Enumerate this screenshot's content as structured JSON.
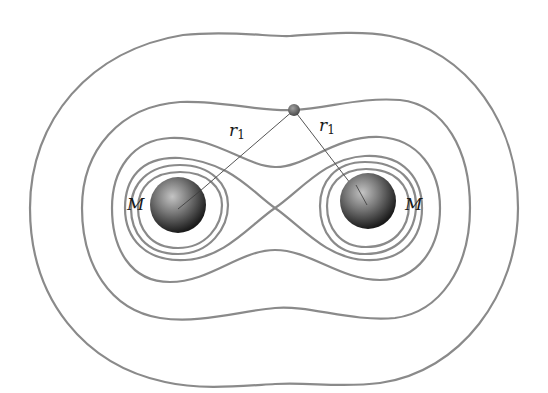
{
  "figure": {
    "labels": {
      "mass_left": "M",
      "mass_right": "M",
      "r_left_main": "r",
      "r_left_sub": "1",
      "r_right_main": "r",
      "r_right_sub": "1"
    },
    "colors": {
      "contour": "#8a8a8a",
      "line": "#555555",
      "sphere_dark": "#1e1e1e",
      "sphere_light": "#bdbdbd",
      "point": "#6a6a6a",
      "background": "#ffffff"
    }
  }
}
